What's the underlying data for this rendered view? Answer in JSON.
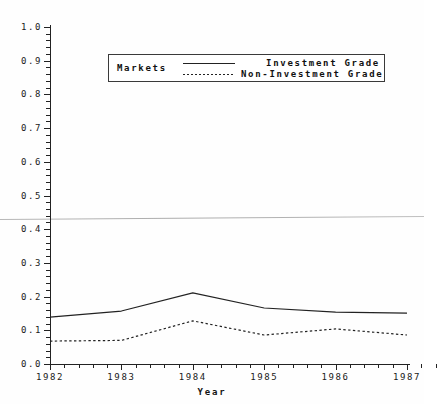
{
  "chart_data": {
    "type": "line",
    "title": "",
    "xlabel": "Year",
    "ylabel": "",
    "categories": [
      "1982",
      "1983",
      "1984",
      "1985",
      "1986",
      "1987"
    ],
    "x": [
      1982,
      1983,
      1984,
      1985,
      1986,
      1987
    ],
    "xlim": [
      1982,
      1987
    ],
    "ylim": [
      0.0,
      1.0
    ],
    "grid": false,
    "legend_position": "upper-center",
    "legend_title": "Markets",
    "y_ticks": [
      "0.0",
      "0.1",
      "0.2",
      "0.3",
      "0.4",
      "0.5",
      "0.6",
      "0.7",
      "0.8",
      "0.9",
      "1.0"
    ],
    "y_tick_values": [
      0.0,
      0.1,
      0.2,
      0.3,
      0.4,
      0.5,
      0.6,
      0.7,
      0.8,
      0.9,
      1.0
    ],
    "y_minor_ticks_per_major": 4,
    "x_minor_ticks_per_major": 4,
    "series": [
      {
        "name": "Investment Grade",
        "style": "solid",
        "color": "#222222",
        "values": [
          0.139,
          0.157,
          0.211,
          0.166,
          0.154,
          0.151
        ]
      },
      {
        "name": "Non-Investment Grade",
        "style": "dotted",
        "color": "#222222",
        "values": [
          0.068,
          0.07,
          0.128,
          0.086,
          0.104,
          0.086
        ]
      }
    ],
    "annotations": []
  },
  "figure": {
    "background_color": "#fefefe",
    "axis_color": "#222222",
    "artifact_note": "scan-crease"
  }
}
